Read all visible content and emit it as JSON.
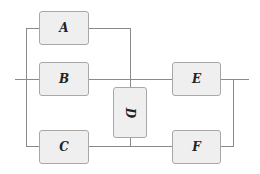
{
  "diagram": {
    "type": "reliability-block-diagram",
    "blocks": [
      {
        "id": "A",
        "label": "A"
      },
      {
        "id": "B",
        "label": "B"
      },
      {
        "id": "C",
        "label": "C"
      },
      {
        "id": "D",
        "label": "D",
        "orientation": "vertical"
      },
      {
        "id": "E",
        "label": "E"
      },
      {
        "id": "F",
        "label": "F"
      }
    ],
    "connections": [
      [
        "input",
        "A"
      ],
      [
        "input",
        "B"
      ],
      [
        "input",
        "C"
      ],
      [
        "A",
        "D"
      ],
      [
        "C",
        "D"
      ],
      [
        "B",
        "E"
      ],
      [
        "C",
        "F"
      ],
      [
        "D",
        "E"
      ],
      [
        "D",
        "F"
      ],
      [
        "E",
        "output"
      ],
      [
        "F",
        "output"
      ]
    ],
    "colors": {
      "block_fill": "#efefef",
      "block_border": "#a8a8a8",
      "wire": "#8a8a8a",
      "label": "#222222"
    }
  }
}
